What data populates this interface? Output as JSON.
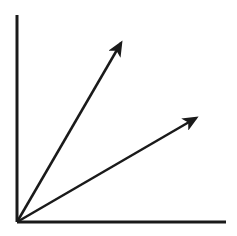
{
  "diagram": {
    "type": "vector-diagram",
    "stroke_color": "#1a1a1a",
    "background": "#ffffff",
    "origin": [
      17,
      222
    ],
    "axes": {
      "y_axis": {
        "from": [
          17,
          222
        ],
        "to": [
          17,
          15
        ]
      },
      "x_axis": {
        "from": [
          17,
          222
        ],
        "to": [
          226,
          222
        ]
      }
    },
    "vectors": [
      {
        "name": "upper-vector",
        "from": [
          17,
          222
        ],
        "to": [
          121,
          43
        ]
      },
      {
        "name": "lower-vector",
        "from": [
          17,
          222
        ],
        "to": [
          196,
          118
        ]
      }
    ]
  }
}
